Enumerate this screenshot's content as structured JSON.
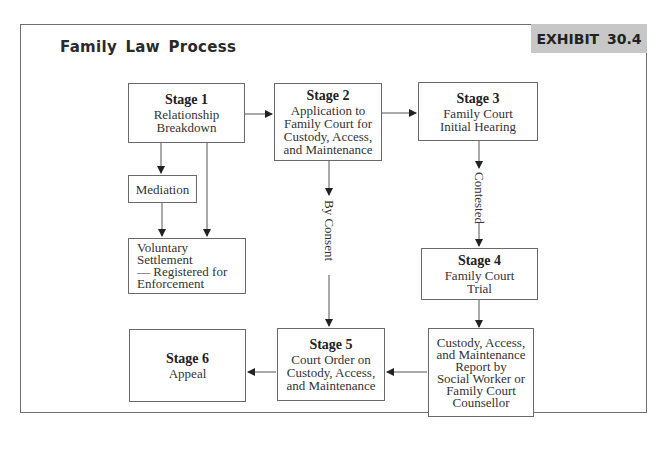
{
  "header": {
    "title": "Family Law Process",
    "exhibit": "EXHIBIT 30.4"
  },
  "nodes": {
    "stage1": {
      "stage": "Stage 1",
      "desc": "Relationship\nBreakdown"
    },
    "stage2": {
      "stage": "Stage 2",
      "desc": "Application to\nFamily Court for\nCustody, Access,\nand Maintenance"
    },
    "stage3": {
      "stage": "Stage 3",
      "desc": "Family Court\nInitial Hearing"
    },
    "mediation": {
      "desc": "Mediation"
    },
    "voluntary": {
      "desc": "Voluntary Settlement\n— Registered for\nEnforcement"
    },
    "stage4": {
      "stage": "Stage 4",
      "desc": "Family Court\nTrial"
    },
    "report": {
      "desc": "Custody, Access,\nand Maintenance\nReport by\nSocial Worker or\nFamily Court\nCounsellor"
    },
    "stage5": {
      "stage": "Stage 5",
      "desc": "Court Order on\nCustody, Access,\nand Maintenance"
    },
    "stage6": {
      "stage": "Stage 6",
      "desc": "Appeal"
    }
  },
  "edge_labels": {
    "by_consent": "By Consent",
    "contested": "Contested"
  },
  "edges": [
    {
      "from": "stage1",
      "to": "stage2"
    },
    {
      "from": "stage2",
      "to": "stage3"
    },
    {
      "from": "stage1",
      "to": "mediation"
    },
    {
      "from": "stage1",
      "to": "voluntary"
    },
    {
      "from": "mediation",
      "to": "voluntary"
    },
    {
      "from": "stage2",
      "to": "stage5",
      "label": "By Consent"
    },
    {
      "from": "stage3",
      "to": "stage4",
      "label": "Contested"
    },
    {
      "from": "stage4",
      "to": "report"
    },
    {
      "from": "report",
      "to": "stage5"
    },
    {
      "from": "stage5",
      "to": "stage6"
    }
  ]
}
